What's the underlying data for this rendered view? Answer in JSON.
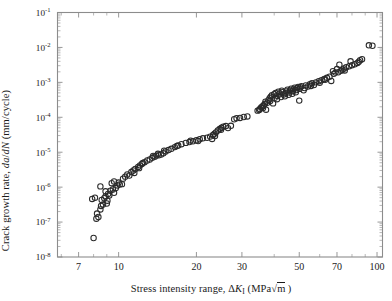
{
  "figure": {
    "kind": "scatter-plot",
    "background_color": "#ffffff",
    "frame_color": "#8c8c8c",
    "marker_color": "#2a2a2a",
    "marker_style": "open-circle",
    "marker_diameter_px": 5.4
  },
  "chart_data": {
    "type": "scatter",
    "title": "",
    "xlabel": "Stress intensity range, ΔKᵢ (MPa√m)",
    "ylabel": "Crack growth rate, da/dN (mm/cycle)",
    "xscale": "log",
    "yscale": "log",
    "xlim": [
      5.8,
      105
    ],
    "ylim": [
      1e-08,
      0.1
    ],
    "grid": false,
    "legend": "none",
    "xtick_labels": [
      "7",
      "10",
      "20",
      "30",
      "50",
      "70",
      "100"
    ],
    "xtick_values": [
      7,
      10,
      20,
      30,
      50,
      70,
      100
    ],
    "ytick_labels": [
      "10⁻⁸",
      "10⁻⁷",
      "10⁻⁶",
      "10⁻⁵",
      "10⁻⁴",
      "10⁻³",
      "10⁻²",
      "10⁻¹"
    ],
    "ytick_values": [
      1e-08,
      1e-07,
      1e-06,
      1e-05,
      0.0001,
      0.001,
      0.01,
      0.1
    ],
    "series": [
      {
        "name": "Fatigue crack growth data",
        "marker": "open-circle",
        "points": [
          [
            8.0,
            3.5e-08
          ],
          [
            8.2,
            1.25e-07
          ],
          [
            8.35,
            1.4e-07
          ],
          [
            8.25,
            1.75e-07
          ],
          [
            8.5,
            2.3e-07
          ],
          [
            8.55,
            2.9e-07
          ],
          [
            8.7,
            3.2e-07
          ],
          [
            9.0,
            3.4e-07
          ],
          [
            7.9,
            4.6e-07
          ],
          [
            8.1,
            5e-07
          ],
          [
            8.6,
            4.3e-07
          ],
          [
            8.8,
            4.8e-07
          ],
          [
            8.9,
            5.4e-07
          ],
          [
            9.05,
            4.1e-07
          ],
          [
            9.2,
            5.8e-07
          ],
          [
            9.1,
            6.4e-07
          ],
          [
            8.5,
            1.05e-06
          ],
          [
            8.9,
            7.6e-07
          ],
          [
            9.3,
            7.9e-07
          ],
          [
            9.5,
            8.6e-07
          ],
          [
            9.6,
            6.9e-07
          ],
          [
            9.75,
            9.4e-07
          ],
          [
            9.9,
            1.12e-06
          ],
          [
            10.1,
            1.2e-06
          ],
          [
            9.4,
            1.3e-06
          ],
          [
            9.6,
            1.45e-06
          ],
          [
            10.0,
            1.35e-06
          ],
          [
            10.3,
            1.22e-06
          ],
          [
            10.4,
            1.75e-06
          ],
          [
            10.6,
            2e-06
          ],
          [
            10.8,
            2.3e-06
          ],
          [
            11.0,
            2.15e-06
          ],
          [
            11.2,
            2.7e-06
          ],
          [
            11.4,
            3e-06
          ],
          [
            11.6,
            3.3e-06
          ],
          [
            11.5,
            2.55e-06
          ],
          [
            11.9,
            3.8e-06
          ],
          [
            12.1,
            4.2e-06
          ],
          [
            12.3,
            4.6e-06
          ],
          [
            12.0,
            3.5e-06
          ],
          [
            12.6,
            5.2e-06
          ],
          [
            12.9,
            5.8e-06
          ],
          [
            13.2,
            6.2e-06
          ],
          [
            12.4,
            4.9e-06
          ],
          [
            13.5,
            6.9e-06
          ],
          [
            13.8,
            7.4e-06
          ],
          [
            14.0,
            8e-06
          ],
          [
            13.6,
            7.8e-06
          ],
          [
            14.3,
            8.2e-06
          ],
          [
            14.6,
            8.6e-06
          ],
          [
            14.2,
            9e-06
          ],
          [
            14.9,
            9.3e-06
          ],
          [
            15.2,
            1.05e-05
          ],
          [
            15.6,
            1.15e-05
          ],
          [
            16.0,
            1.25e-05
          ],
          [
            15.0,
            1.1e-05
          ],
          [
            16.5,
            1.4e-05
          ],
          [
            17.0,
            1.55e-05
          ],
          [
            17.5,
            1.7e-05
          ],
          [
            16.8,
            1.5e-05
          ],
          [
            18.2,
            1.85e-05
          ],
          [
            18.8,
            1.95e-05
          ],
          [
            19.4,
            2.05e-05
          ],
          [
            19.0,
            2.15e-05
          ],
          [
            20.0,
            2.2e-05
          ],
          [
            20.6,
            2.35e-05
          ],
          [
            21.2,
            2.5e-05
          ],
          [
            20.3,
            2.1e-05
          ],
          [
            22.0,
            2.6e-05
          ],
          [
            22.6,
            2.8e-05
          ],
          [
            23.0,
            2.4e-05
          ],
          [
            23.2,
            3.1e-05
          ],
          [
            23.5,
            3.4e-05
          ],
          [
            23.8,
            3.7e-05
          ],
          [
            23.6,
            2.9e-05
          ],
          [
            24.2,
            4.2e-05
          ],
          [
            24.6,
            4.6e-05
          ],
          [
            25.0,
            5e-05
          ],
          [
            25.4,
            5.4e-05
          ],
          [
            24.9,
            4.4e-05
          ],
          [
            26.0,
            5.6e-05
          ],
          [
            26.5,
            4.9e-05
          ],
          [
            27.2,
            5.7e-05
          ],
          [
            28.0,
            8.8e-05
          ],
          [
            28.6,
            9.4e-05
          ],
          [
            29.5,
            9.6e-05
          ],
          [
            30.5,
            0.000102
          ],
          [
            31.5,
            0.000106
          ],
          [
            34.5,
            0.000155
          ],
          [
            35.2,
            0.000172
          ],
          [
            35.6,
            0.00019
          ],
          [
            35.0,
            0.000162
          ],
          [
            36.0,
            0.000205
          ],
          [
            36.4,
            0.00022
          ],
          [
            36.8,
            0.00024
          ],
          [
            36.2,
            0.000185
          ],
          [
            37.2,
            0.000165
          ],
          [
            37.6,
            0.00026
          ],
          [
            38.0,
            0.00031
          ],
          [
            37.0,
            0.00028
          ],
          [
            38.4,
            0.00035
          ],
          [
            38.8,
            0.00039
          ],
          [
            39.2,
            0.00043
          ],
          [
            38.6,
            0.000295
          ],
          [
            39.6,
            0.00025
          ],
          [
            40.0,
            0.00046
          ],
          [
            40.5,
            0.0005
          ],
          [
            40.2,
            0.00036
          ],
          [
            41.0,
            0.00033
          ],
          [
            41.5,
            0.00054
          ],
          [
            42.0,
            0.00048
          ],
          [
            41.2,
            0.00041
          ],
          [
            42.5,
            0.00038
          ],
          [
            43.0,
            0.00052
          ],
          [
            43.5,
            0.00045
          ],
          [
            42.8,
            0.00058
          ],
          [
            44.0,
            0.0004
          ],
          [
            44.5,
            0.00055
          ],
          [
            45.0,
            0.00062
          ],
          [
            44.2,
            0.00049
          ],
          [
            45.5,
            0.00044
          ],
          [
            46.0,
            0.00059
          ],
          [
            46.5,
            0.00066
          ],
          [
            45.8,
            0.00051
          ],
          [
            47.0,
            0.00047
          ],
          [
            47.5,
            0.00063
          ],
          [
            48.0,
            0.0007
          ],
          [
            47.2,
            0.00056
          ],
          [
            48.5,
            0.00052
          ],
          [
            49.0,
            0.00068
          ],
          [
            49.5,
            0.00074
          ],
          [
            48.8,
            0.0006
          ],
          [
            50.0,
            0.0003
          ],
          [
            50.5,
            0.00072
          ],
          [
            51.0,
            0.00078
          ],
          [
            50.2,
            0.00065
          ],
          [
            52.0,
            0.00059
          ],
          [
            53.0,
            0.00082
          ],
          [
            54.0,
            0.00076
          ],
          [
            52.5,
            0.00069
          ],
          [
            55.0,
            0.00088
          ],
          [
            56.0,
            0.00094
          ],
          [
            57.0,
            0.00084
          ],
          [
            55.5,
            0.00079
          ],
          [
            58.0,
            0.001
          ],
          [
            59.5,
            0.00108
          ],
          [
            61.0,
            0.00115
          ],
          [
            60.0,
            0.00098
          ],
          [
            62.5,
            0.00125
          ],
          [
            64.0,
            0.00135
          ],
          [
            65.5,
            0.00145
          ],
          [
            63.0,
            0.00118
          ],
          [
            66.5,
            0.0011
          ],
          [
            68.0,
            0.00175
          ],
          [
            69.0,
            0.0019
          ],
          [
            67.5,
            0.0021
          ],
          [
            70.0,
            0.0024
          ],
          [
            71.5,
            0.0032
          ],
          [
            72.5,
            0.00215
          ],
          [
            70.8,
            0.00195
          ],
          [
            73.5,
            0.0023
          ],
          [
            74.5,
            0.0025
          ],
          [
            76.0,
            0.0027
          ],
          [
            75.0,
            0.0022
          ],
          [
            78.0,
            0.0029
          ],
          [
            80.0,
            0.0031
          ],
          [
            82.0,
            0.0033
          ],
          [
            79.0,
            0.004
          ],
          [
            84.0,
            0.0036
          ],
          [
            86.0,
            0.0043
          ],
          [
            87.5,
            0.0046
          ],
          [
            85.0,
            0.0039
          ],
          [
            93.0,
            0.0115
          ],
          [
            96.0,
            0.0112
          ]
        ]
      }
    ]
  }
}
